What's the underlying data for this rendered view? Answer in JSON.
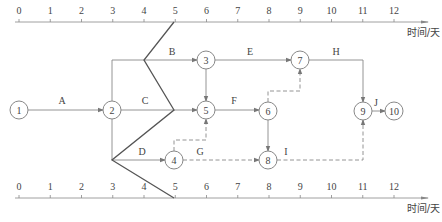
{
  "diagram": {
    "type": "time-scaled network diagram with progress front line",
    "colors": {
      "line": "#888888",
      "front": "#555555",
      "text": "#444444",
      "bg": "#ffffff"
    },
    "top_axis": {
      "y": 22,
      "x0": 19,
      "unit_px": 31.25,
      "ticks": [
        "0",
        "1",
        "2",
        "3",
        "4",
        "5",
        "6",
        "7",
        "8",
        "9",
        "10",
        "11",
        "12"
      ],
      "unit_label": "时间/天",
      "arrow_end_x": 428
    },
    "bottom_axis": {
      "y": 198,
      "x0": 19,
      "unit_px": 31.25,
      "ticks": [
        "0",
        "1",
        "2",
        "3",
        "4",
        "5",
        "6",
        "7",
        "8",
        "9",
        "10",
        "11",
        "12"
      ],
      "unit_label": "时间/天",
      "arrow_end_x": 428
    },
    "nodes": [
      {
        "id": "1",
        "x": 19,
        "y": 110
      },
      {
        "id": "2",
        "x": 112,
        "y": 110
      },
      {
        "id": "3",
        "x": 206,
        "y": 60
      },
      {
        "id": "4",
        "x": 174,
        "y": 160
      },
      {
        "id": "5",
        "x": 206,
        "y": 110
      },
      {
        "id": "6",
        "x": 268,
        "y": 111
      },
      {
        "id": "7",
        "x": 300,
        "y": 60
      },
      {
        "id": "8",
        "x": 268,
        "y": 160
      },
      {
        "id": "9",
        "x": 363,
        "y": 111
      },
      {
        "id": "10",
        "x": 394,
        "y": 111
      }
    ],
    "activities": [
      {
        "name": "A",
        "from": "1",
        "to": "2",
        "dashed": false,
        "points": [
          [
            28,
            110
          ],
          [
            103,
            110
          ]
        ],
        "label_x": 62,
        "label_y": 104
      },
      {
        "name": "B",
        "from": "2",
        "to": "3",
        "dashed": false,
        "points": [
          [
            112,
            101
          ],
          [
            112,
            60
          ],
          [
            197,
            60
          ]
        ],
        "label_x": 172,
        "label_y": 55
      },
      {
        "name": "C",
        "from": "2",
        "to": "5",
        "dashed": false,
        "points": [
          [
            121,
            110
          ],
          [
            197,
            110
          ]
        ],
        "label_x": 145,
        "label_y": 104
      },
      {
        "name": "D",
        "from": "2",
        "to": "4",
        "dashed": false,
        "points": [
          [
            112,
            119
          ],
          [
            112,
            160
          ],
          [
            165,
            160
          ]
        ],
        "label_x": 142,
        "label_y": 155
      },
      {
        "name": "E",
        "from": "3",
        "to": "7",
        "dashed": false,
        "points": [
          [
            215,
            60
          ],
          [
            291,
            60
          ]
        ],
        "label_x": 250,
        "label_y": 55
      },
      {
        "name": "F",
        "from": "5",
        "to": "6",
        "dashed": false,
        "points": [
          [
            215,
            110
          ],
          [
            259,
            110
          ]
        ],
        "label_x": 234,
        "label_y": 104
      },
      {
        "name": "G",
        "from": "4",
        "to": "8",
        "dashed": true,
        "points": [
          [
            183,
            160
          ],
          [
            259,
            160
          ]
        ],
        "label_x": 200,
        "label_y": 155
      },
      {
        "name": "H",
        "from": "7",
        "to": "9",
        "dashed": false,
        "points": [
          [
            309,
            60
          ],
          [
            363,
            60
          ],
          [
            363,
            102
          ]
        ],
        "label_x": 336,
        "label_y": 55
      },
      {
        "name": "I",
        "from": "8",
        "to": "9",
        "dashed": true,
        "points": [
          [
            277,
            160
          ],
          [
            363,
            160
          ],
          [
            363,
            120
          ]
        ],
        "label_x": 286,
        "label_y": 155
      },
      {
        "name": "J",
        "from": "9",
        "to": "10",
        "dashed": false,
        "points": [
          [
            372,
            111
          ],
          [
            385,
            111
          ]
        ],
        "label_x": 376,
        "label_y": 106
      },
      {
        "name": "",
        "from": "3",
        "to": "5",
        "dashed": false,
        "points": [
          [
            206,
            69
          ],
          [
            206,
            101
          ]
        ],
        "label_x": 0,
        "label_y": 0
      },
      {
        "name": "",
        "from": "6",
        "to": "8",
        "dashed": false,
        "points": [
          [
            268,
            120
          ],
          [
            268,
            151
          ]
        ],
        "label_x": 0,
        "label_y": 0
      },
      {
        "name": "",
        "from": "4",
        "to": "5",
        "dashed": true,
        "points": [
          [
            174,
            151
          ],
          [
            174,
            140
          ],
          [
            206,
            140
          ],
          [
            206,
            119
          ]
        ],
        "label_x": 0,
        "label_y": 0
      },
      {
        "name": "",
        "from": "6",
        "to": "7",
        "dashed": true,
        "points": [
          [
            268,
            102
          ],
          [
            268,
            91
          ],
          [
            300,
            91
          ],
          [
            300,
            69
          ]
        ],
        "label_x": 0,
        "label_y": 0
      }
    ],
    "front_line": {
      "label": "实际进度前锋线",
      "points": [
        [
          174,
          22
        ],
        [
          144,
          60
        ],
        [
          174,
          110
        ],
        [
          112,
          160
        ],
        [
          174,
          198
        ]
      ]
    }
  }
}
